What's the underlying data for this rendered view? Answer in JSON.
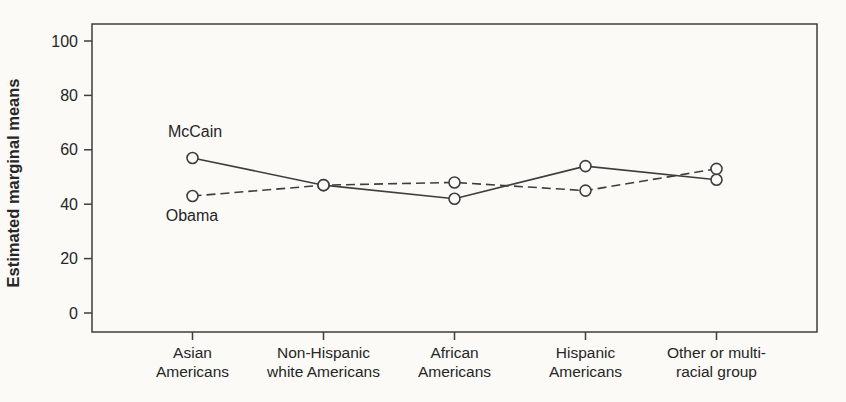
{
  "chart_data": {
    "type": "line",
    "title": "",
    "xlabel": "",
    "ylabel": "Estimated marginal means",
    "categories": [
      "Asian Americans",
      "Non-Hispanic white Americans",
      "African Americans",
      "Hispanic Americans",
      "Other or multi-racial group"
    ],
    "category_label_lines": [
      [
        "Asian",
        "Americans"
      ],
      [
        "Non-Hispanic",
        "white Americans"
      ],
      [
        "African",
        "Americans"
      ],
      [
        "Hispanic",
        "Americans"
      ],
      [
        "Other or multi-",
        "racial group"
      ]
    ],
    "series": [
      {
        "name": "McCain",
        "line_style": "solid",
        "marker": "open-circle",
        "values": [
          57,
          47,
          42,
          54,
          49
        ]
      },
      {
        "name": "Obama",
        "line_style": "dashed",
        "marker": "open-circle",
        "values": [
          43,
          47,
          48,
          45,
          53
        ]
      }
    ],
    "annotations": [
      {
        "text": "McCain",
        "series": "McCain",
        "position": "above first point"
      },
      {
        "text": "Obama",
        "series": "Obama",
        "position": "below first point"
      }
    ],
    "yticks": [
      0,
      20,
      40,
      60,
      80,
      100
    ],
    "ylim": [
      0,
      100
    ],
    "grid": false,
    "legend_position": "inline-annotations",
    "colors": {
      "line": "#3e3e3e",
      "text": "#262626",
      "background": "#fbfaf7"
    }
  }
}
